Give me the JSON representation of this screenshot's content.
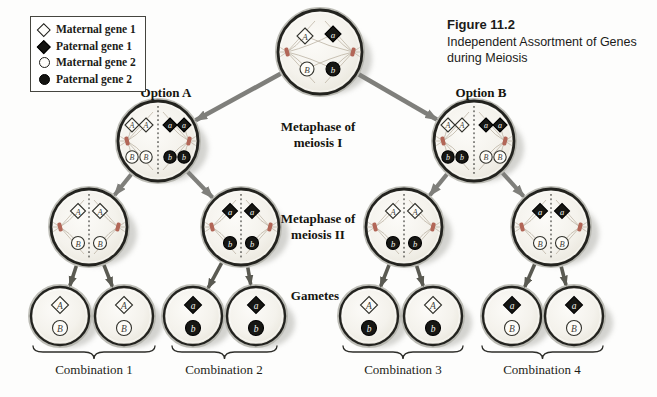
{
  "figure": {
    "number": "Figure 11.2",
    "title": "Independent Assortment of Genes during Meiosis"
  },
  "legend": {
    "items": [
      {
        "label": "Maternal gene 1",
        "shape": "diamond",
        "fill": "white"
      },
      {
        "label": "Paternal gene 1",
        "shape": "diamond",
        "fill": "black"
      },
      {
        "label": "Maternal gene 2",
        "shape": "circle",
        "fill": "white"
      },
      {
        "label": "Paternal gene 2",
        "shape": "circle",
        "fill": "black"
      }
    ]
  },
  "labels": {
    "option_a": "Option A",
    "option_b": "Option B",
    "metaphase_1": "Metaphase of\nmeiosis I",
    "metaphase_2": "Metaphase of\nmeiosis II",
    "gametes": "Gametes",
    "combinations": [
      "Combination 1",
      "Combination 2",
      "Combination 3",
      "Combination 4"
    ]
  },
  "colors": {
    "arrow_gray": "#7f7f7b",
    "arrow_dark": "#5a5a52",
    "cell_rim": "#23231f",
    "spindle_pole": "#b26657",
    "spindle_fiber": "#b9af9f"
  },
  "cells": {
    "parent": {
      "name": "parent-cell",
      "genes": [
        {
          "shape": "diamond",
          "fill": "white",
          "allele": "A"
        },
        {
          "shape": "diamond",
          "fill": "black",
          "allele": "a"
        },
        {
          "shape": "circle",
          "fill": "white",
          "allele": "B"
        },
        {
          "shape": "circle",
          "fill": "black",
          "allele": "b"
        }
      ]
    },
    "m1a": {
      "name": "metaphase1-option-a-cell",
      "genes": [
        {
          "shape": "diamond",
          "fill": "white",
          "allele": "A"
        },
        {
          "shape": "diamond",
          "fill": "white",
          "allele": "A"
        },
        {
          "shape": "diamond",
          "fill": "black",
          "allele": "a"
        },
        {
          "shape": "diamond",
          "fill": "black",
          "allele": "a"
        },
        {
          "shape": "circle",
          "fill": "white",
          "allele": "B"
        },
        {
          "shape": "circle",
          "fill": "white",
          "allele": "B"
        },
        {
          "shape": "circle",
          "fill": "black",
          "allele": "b"
        },
        {
          "shape": "circle",
          "fill": "black",
          "allele": "b"
        }
      ]
    },
    "m1b": {
      "name": "metaphase1-option-b-cell",
      "genes": [
        {
          "shape": "diamond",
          "fill": "white",
          "allele": "A"
        },
        {
          "shape": "diamond",
          "fill": "white",
          "allele": "A"
        },
        {
          "shape": "diamond",
          "fill": "black",
          "allele": "a"
        },
        {
          "shape": "diamond",
          "fill": "black",
          "allele": "a"
        },
        {
          "shape": "circle",
          "fill": "black",
          "allele": "b"
        },
        {
          "shape": "circle",
          "fill": "black",
          "allele": "b"
        },
        {
          "shape": "circle",
          "fill": "white",
          "allele": "B"
        },
        {
          "shape": "circle",
          "fill": "white",
          "allele": "B"
        }
      ]
    },
    "m2_1": {
      "name": "metaphase2-cell-1",
      "genes": [
        {
          "shape": "diamond",
          "fill": "white",
          "allele": "A"
        },
        {
          "shape": "diamond",
          "fill": "white",
          "allele": "A"
        },
        {
          "shape": "circle",
          "fill": "white",
          "allele": "B"
        },
        {
          "shape": "circle",
          "fill": "white",
          "allele": "B"
        }
      ]
    },
    "m2_2": {
      "name": "metaphase2-cell-2",
      "genes": [
        {
          "shape": "diamond",
          "fill": "black",
          "allele": "a"
        },
        {
          "shape": "diamond",
          "fill": "black",
          "allele": "a"
        },
        {
          "shape": "circle",
          "fill": "black",
          "allele": "b"
        },
        {
          "shape": "circle",
          "fill": "black",
          "allele": "b"
        }
      ]
    },
    "m2_3": {
      "name": "metaphase2-cell-3",
      "genes": [
        {
          "shape": "diamond",
          "fill": "white",
          "allele": "A"
        },
        {
          "shape": "diamond",
          "fill": "white",
          "allele": "A"
        },
        {
          "shape": "circle",
          "fill": "black",
          "allele": "b"
        },
        {
          "shape": "circle",
          "fill": "black",
          "allele": "b"
        }
      ]
    },
    "m2_4": {
      "name": "metaphase2-cell-4",
      "genes": [
        {
          "shape": "diamond",
          "fill": "black",
          "allele": "a"
        },
        {
          "shape": "diamond",
          "fill": "black",
          "allele": "a"
        },
        {
          "shape": "circle",
          "fill": "white",
          "allele": "B"
        },
        {
          "shape": "circle",
          "fill": "white",
          "allele": "B"
        }
      ]
    },
    "g1": {
      "name": "gamete-1",
      "genes": [
        {
          "shape": "diamond",
          "fill": "white",
          "allele": "A"
        },
        {
          "shape": "circle",
          "fill": "white",
          "allele": "B"
        }
      ]
    },
    "g2": {
      "name": "gamete-2",
      "genes": [
        {
          "shape": "diamond",
          "fill": "white",
          "allele": "A"
        },
        {
          "shape": "circle",
          "fill": "white",
          "allele": "B"
        }
      ]
    },
    "g3": {
      "name": "gamete-3",
      "genes": [
        {
          "shape": "diamond",
          "fill": "black",
          "allele": "a"
        },
        {
          "shape": "circle",
          "fill": "black",
          "allele": "b"
        }
      ]
    },
    "g4": {
      "name": "gamete-4",
      "genes": [
        {
          "shape": "diamond",
          "fill": "black",
          "allele": "a"
        },
        {
          "shape": "circle",
          "fill": "black",
          "allele": "b"
        }
      ]
    },
    "g5": {
      "name": "gamete-5",
      "genes": [
        {
          "shape": "diamond",
          "fill": "white",
          "allele": "A"
        },
        {
          "shape": "circle",
          "fill": "black",
          "allele": "b"
        }
      ]
    },
    "g6": {
      "name": "gamete-6",
      "genes": [
        {
          "shape": "diamond",
          "fill": "white",
          "allele": "A"
        },
        {
          "shape": "circle",
          "fill": "black",
          "allele": "b"
        }
      ]
    },
    "g7": {
      "name": "gamete-7",
      "genes": [
        {
          "shape": "diamond",
          "fill": "black",
          "allele": "a"
        },
        {
          "shape": "circle",
          "fill": "white",
          "allele": "B"
        }
      ]
    },
    "g8": {
      "name": "gamete-8",
      "genes": [
        {
          "shape": "diamond",
          "fill": "black",
          "allele": "a"
        },
        {
          "shape": "circle",
          "fill": "white",
          "allele": "B"
        }
      ]
    }
  }
}
